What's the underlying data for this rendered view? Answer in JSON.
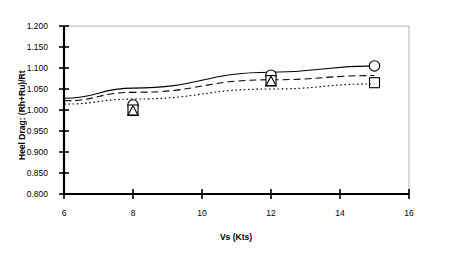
{
  "chart_data": {
    "type": "line",
    "title": "",
    "xlabel": "Vs (Kts)",
    "ylabel": "Heel Drag: (Rh+Ru)/Rt",
    "xlim": [
      6,
      16
    ],
    "ylim": [
      0.8,
      1.2
    ],
    "xticks": [
      "6",
      "8",
      "10",
      "12",
      "14",
      "16"
    ],
    "xtick_values": [
      6,
      8,
      10,
      12,
      14,
      16
    ],
    "yticks": [
      "0.800",
      "0.850",
      "0.900",
      "0.950",
      "1.000",
      "1.050",
      "1.100",
      "1.150",
      "1.200"
    ],
    "ytick_values": [
      0.8,
      0.85,
      0.9,
      0.95,
      1.0,
      1.05,
      1.1,
      1.15,
      1.2
    ],
    "grid": false,
    "legend": "none",
    "frame_color": "#b3b3b3",
    "axis_color": "#000000",
    "series": [
      {
        "name": "circle-series",
        "linestyle": "solid",
        "marker": "circle",
        "color": "#000000",
        "x": [
          6,
          8,
          12,
          15
        ],
        "values": [
          1.028,
          1.052,
          1.09,
          1.105
        ],
        "markers_x": [
          8,
          12,
          15
        ],
        "markers_y": [
          1.012,
          1.083,
          1.105
        ]
      },
      {
        "name": "square-series",
        "linestyle": "dashed",
        "marker": "square",
        "color": "#000000",
        "x": [
          6,
          8,
          12,
          15
        ],
        "values": [
          1.022,
          1.042,
          1.072,
          1.082
        ],
        "markers_x": [
          8,
          12,
          15
        ],
        "markers_y": [
          1.0,
          1.07,
          1.065
        ]
      },
      {
        "name": "triangle-series",
        "linestyle": "dotted",
        "marker": "triangle",
        "color": "#000000",
        "x": [
          6,
          8,
          12,
          15
        ],
        "values": [
          1.014,
          1.026,
          1.05,
          1.062
        ],
        "markers_x": [
          8,
          12
        ],
        "markers_y": [
          0.998,
          1.068
        ]
      }
    ]
  }
}
